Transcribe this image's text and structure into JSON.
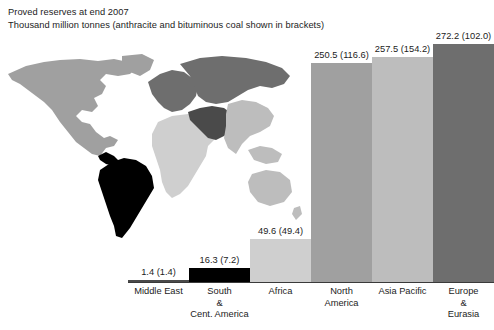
{
  "header": {
    "title_line1": "Proved reserves at end 2007",
    "title_line2": "Thousand million tonnes (anthracite and bituminous coal shown in brackets)"
  },
  "map": {
    "name": "world-choropleth",
    "regions": [
      {
        "key": "middle-east",
        "label": "Middle East",
        "color": "#4a4a4a"
      },
      {
        "key": "south-and-cent-america",
        "label": "South & Cent. America",
        "color": "#000000"
      },
      {
        "key": "africa",
        "label": "Africa",
        "color": "#cfcfcf"
      },
      {
        "key": "north-america",
        "label": "North America",
        "color": "#a0a0a0"
      },
      {
        "key": "asia-pacific",
        "label": "Asia Pacific",
        "color": "#bdbdbd"
      },
      {
        "key": "europe-and-eurasia",
        "label": "Europe & Eurasia",
        "color": "#6e6e6e"
      },
      {
        "key": "unshaded",
        "label": "Not categorised",
        "color": "#ffffff"
      }
    ]
  },
  "chart_data": {
    "type": "bar",
    "title": "Proved reserves at end 2007",
    "subtitle": "Thousand million tonnes (anthracite and bituminous coal shown in brackets)",
    "xlabel": "",
    "ylabel": "Thousand million tonnes",
    "ylim": [
      0,
      272.2
    ],
    "grid": false,
    "legend": "none",
    "categories": [
      "Middle East",
      "South & Cent. America",
      "Africa",
      "North America",
      "Asia Pacific",
      "Europe & Eurasia"
    ],
    "category_lines": [
      [
        "Middle East"
      ],
      [
        "South",
        "&",
        "Cent. America"
      ],
      [
        "Africa"
      ],
      [
        "North",
        "America"
      ],
      [
        "Asia Pacific"
      ],
      [
        "Europe",
        "&",
        "Eurasia"
      ]
    ],
    "series": [
      {
        "name": "Total proved reserves",
        "values": [
          1.4,
          16.3,
          49.6,
          250.5,
          257.5,
          272.2
        ]
      },
      {
        "name": "Anthracite and bituminous (brackets)",
        "values": [
          1.4,
          7.2,
          49.4,
          116.6,
          154.2,
          102.0
        ]
      }
    ],
    "data_labels": [
      "1.4 (1.4)",
      "16.3 (7.2)",
      "49.6 (49.4)",
      "250.5 (116.6)",
      "257.5 (154.2)",
      "272.2 (102.0)"
    ],
    "bar_colors": [
      "#4a4a4a",
      "#000000",
      "#cfcfcf",
      "#a0a0a0",
      "#bdbdbd",
      "#6e6e6e"
    ],
    "bar_names": [
      "bar-middle-east",
      "bar-south-and-cent-america",
      "bar-africa",
      "bar-north-america",
      "bar-asia-pacific",
      "bar-europe-and-eurasia"
    ]
  }
}
